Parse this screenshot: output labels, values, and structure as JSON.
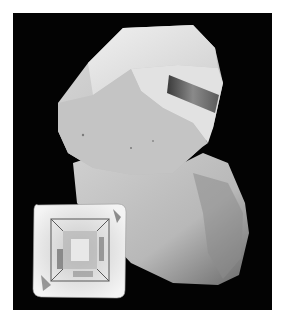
{
  "image": {
    "kind": "photograph",
    "subject": "mineral crystal on rock matrix with faceted square-cut gemstone",
    "style": "grayscale",
    "background_color": "#030303",
    "border_color": "#ffffff"
  },
  "objects": [
    {
      "name": "crystal-specimen",
      "description": "large pale crystal with a small dark prismatic crystal on top"
    },
    {
      "name": "rock-matrix",
      "description": "granular whitish rock base"
    },
    {
      "name": "cut-gemstone",
      "description": "square cushion-cut faceted gem, lower left"
    }
  ]
}
